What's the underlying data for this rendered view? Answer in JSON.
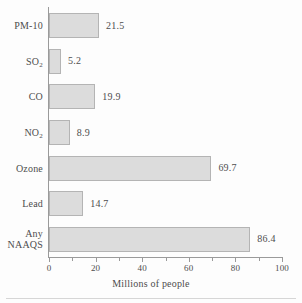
{
  "chart_data": {
    "type": "bar",
    "orientation": "horizontal",
    "title": "",
    "xlabel": "Millions of people",
    "ylabel": "",
    "xlim": [
      0,
      100
    ],
    "grid": false,
    "legend": null,
    "x_major_ticks": [
      0,
      20,
      40,
      60,
      80,
      100
    ],
    "x_minor_ticks": [
      10,
      30,
      50,
      70,
      90
    ],
    "x_tick_labels": [
      "0",
      "20",
      "40",
      "60",
      "80",
      "100"
    ],
    "categories": [
      "PM-10",
      "SO2",
      "CO",
      "NO2",
      "Ozone",
      "Lead",
      "Any NAAQS"
    ],
    "values": [
      21.5,
      5.2,
      19.9,
      8.9,
      69.7,
      14.7,
      86.4
    ],
    "data_labels": [
      "21.5",
      "5.2",
      "19.9",
      "8.9",
      "69.7",
      "14.7",
      "86.4"
    ],
    "series": [
      {
        "name": "Millions of people",
        "values": [
          21.5,
          5.2,
          19.9,
          8.9,
          69.7,
          14.7,
          86.4
        ]
      }
    ],
    "bars": [
      {
        "label_line1": "PM-10",
        "label_line2": "",
        "sub1": "",
        "value": 21.5,
        "value_label": "21.5"
      },
      {
        "label_line1": "SO",
        "label_line2": "",
        "sub1": "2",
        "value": 5.2,
        "value_label": "5.2"
      },
      {
        "label_line1": "CO",
        "label_line2": "",
        "sub1": "",
        "value": 19.9,
        "value_label": "19.9"
      },
      {
        "label_line1": "NO",
        "label_line2": "",
        "sub1": "2",
        "value": 8.9,
        "value_label": "8.9"
      },
      {
        "label_line1": "Ozone",
        "label_line2": "",
        "sub1": "",
        "value": 69.7,
        "value_label": "69.7"
      },
      {
        "label_line1": "Lead",
        "label_line2": "",
        "sub1": "",
        "value": 14.7,
        "value_label": "14.7"
      },
      {
        "label_line1": "Any",
        "label_line2": "NAAQS",
        "sub1": "",
        "value": 86.4,
        "value_label": "86.4"
      }
    ],
    "colors": {
      "bar_fill": "#dcdcdc",
      "bar_border": "#b4b4b4",
      "axis": "#9a9a9a",
      "text": "#4d4d4d",
      "background": "#fdfdfd"
    }
  }
}
